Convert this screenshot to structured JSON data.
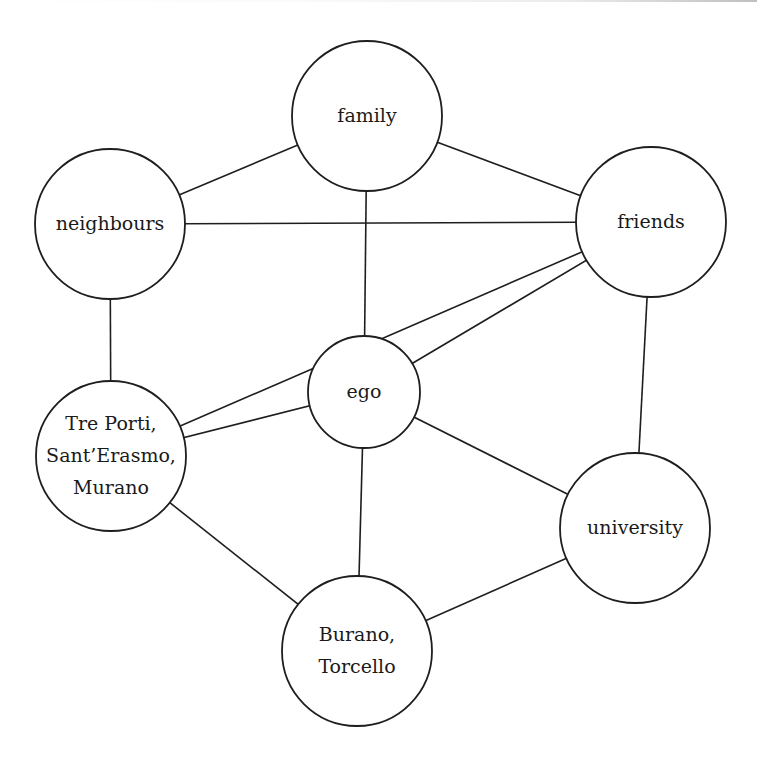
{
  "diagram": {
    "type": "network",
    "nodes": [
      {
        "id": "family",
        "lines": [
          "family"
        ],
        "cx": 367,
        "cy": 116,
        "r": 75
      },
      {
        "id": "neighbours",
        "lines": [
          "neighbours"
        ],
        "cx": 110,
        "cy": 224,
        "r": 75
      },
      {
        "id": "friends",
        "lines": [
          "friends"
        ],
        "cx": 651,
        "cy": 222,
        "r": 75
      },
      {
        "id": "ego",
        "lines": [
          "ego"
        ],
        "cx": 364,
        "cy": 392,
        "r": 56
      },
      {
        "id": "treporti",
        "lines": [
          "Tre Porti,",
          "Sant’Erasmo,",
          "Murano"
        ],
        "cx": 111,
        "cy": 456,
        "r": 75
      },
      {
        "id": "university",
        "lines": [
          "university"
        ],
        "cx": 635,
        "cy": 528,
        "r": 75
      },
      {
        "id": "burano",
        "lines": [
          "Burano,",
          "Torcello"
        ],
        "cx": 357,
        "cy": 651,
        "r": 75
      }
    ],
    "edges": [
      [
        "family",
        "neighbours"
      ],
      [
        "family",
        "friends"
      ],
      [
        "family",
        "ego"
      ],
      [
        "neighbours",
        "friends"
      ],
      [
        "neighbours",
        "treporti"
      ],
      [
        "friends",
        "treporti"
      ],
      [
        "friends",
        "ego"
      ],
      [
        "friends",
        "university"
      ],
      [
        "ego",
        "treporti"
      ],
      [
        "ego",
        "burano"
      ],
      [
        "ego",
        "university"
      ],
      [
        "treporti",
        "burano"
      ],
      [
        "burano",
        "university"
      ]
    ],
    "colors": {
      "stroke": "#1e1e1e",
      "fill": "#ffffff",
      "text": "#1a1a1a"
    }
  }
}
